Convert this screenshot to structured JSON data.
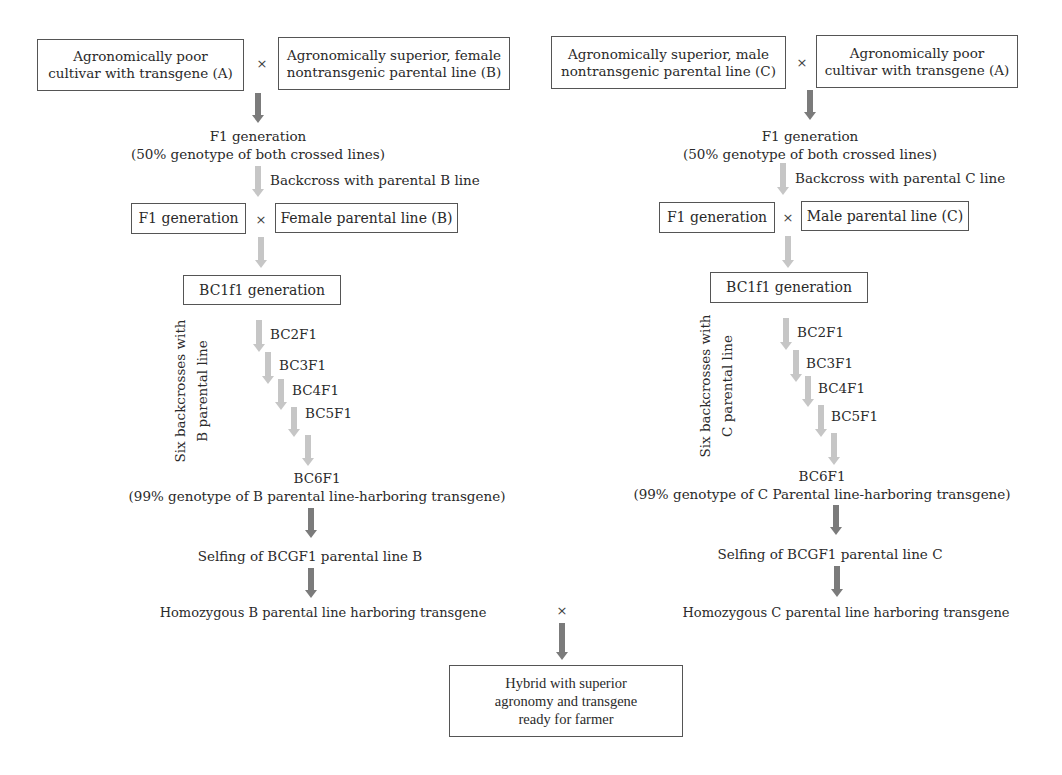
{
  "left": {
    "parent_a": [
      "Agronomically poor",
      "cultivar with transgene (A)"
    ],
    "cross_symbol": "×",
    "parent_b": [
      "Agronomically superior, female",
      "nontransgenic parental line (B)"
    ],
    "f1_title": "F1 generation",
    "f1_note": "(50% genotype of both crossed lines)",
    "backcross_label": "Backcross with parental B line",
    "f1_box": "F1 generation",
    "recurrent_box": "Female parental line (B)",
    "bc1_box": "BC1f1 generation",
    "side_label": [
      "Six backcrosses with",
      "B parental line"
    ],
    "steps": [
      "BC2F1",
      "BC3F1",
      "BC4F1",
      "BC5F1"
    ],
    "bc6_title": "BC6F1",
    "bc6_note": "(99% genotype of B parental line-harboring transgene)",
    "selfing": "Selfing of BCGF1 parental line B",
    "homozygous": "Homozygous B parental line harboring transgene"
  },
  "right": {
    "parent_c": [
      "Agronomically superior, male",
      "nontransgenic parental line (C)"
    ],
    "cross_symbol": "×",
    "parent_a": [
      "Agronomically poor",
      "cultivar with transgene (A)"
    ],
    "f1_title": "F1 generation",
    "f1_note": "(50% genotype of both crossed lines)",
    "backcross_label": "Backcross with parental C line",
    "f1_box": "F1 generation",
    "recurrent_box": "Male parental line (C)",
    "bc1_box": "BC1f1 generation",
    "side_label": [
      "Six backcrosses with",
      "C parental line"
    ],
    "steps": [
      "BC2F1",
      "BC3F1",
      "BC4F1",
      "BC5F1"
    ],
    "bc6_title": "BC6F1",
    "bc6_note": "(99% genotype of C Parental line-harboring transgene)",
    "selfing": "Selfing of BCGF1 parental line C",
    "homozygous": "Homozygous C parental line harboring transgene"
  },
  "final": {
    "cross_symbol": "×",
    "hybrid": [
      "Hybrid with superior",
      "agronomy and transgene",
      "ready for farmer"
    ]
  },
  "colors": {
    "dark_arrow": "#7b7b7b",
    "light_arrow": "#c6c6c6",
    "box_border": "#555555",
    "text": "#2a2a2a"
  }
}
